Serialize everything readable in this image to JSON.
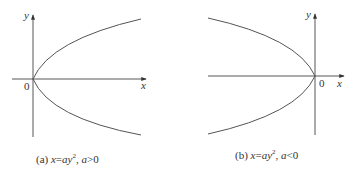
{
  "figures": [
    {
      "id": "a",
      "axis_labels": {
        "x": "x",
        "y": "y",
        "origin": "0"
      },
      "caption": {
        "prefix": "(a)",
        "equation_lhs": "x",
        "equals": "=",
        "equation_rhs": "ay",
        "exponent": "2",
        "separator": ",",
        "condition_var": "a",
        "condition_op": ">",
        "condition_val": "0"
      },
      "curve": "parabola opening right"
    },
    {
      "id": "b",
      "axis_labels": {
        "x": "x",
        "y": "y",
        "origin": "0"
      },
      "caption": {
        "prefix": "(b)",
        "equation_lhs": "x",
        "equals": "=",
        "equation_rhs": "ay",
        "exponent": "2",
        "separator": ",",
        "condition_var": "a",
        "condition_op": "<",
        "condition_val": "0"
      },
      "curve": "parabola opening left"
    }
  ],
  "colors": {
    "stroke": "#555555",
    "text": "#333333"
  }
}
